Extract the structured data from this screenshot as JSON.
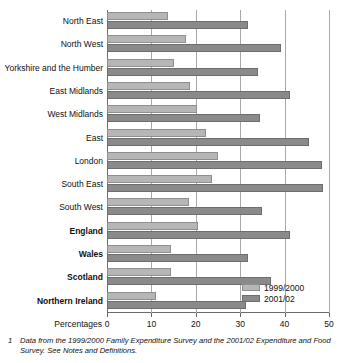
{
  "chart_data": {
    "type": "bar",
    "orientation": "horizontal",
    "title": "",
    "xlabel": "Percentages",
    "ylabel": "",
    "xlim": [
      0,
      50
    ],
    "xticks": [
      0,
      10,
      20,
      30,
      40,
      50
    ],
    "xtick_labels": [
      "0",
      "10",
      "20",
      "30",
      "40",
      "50"
    ],
    "grid": true,
    "legend_position": "bottom-right",
    "categories": [
      "North East",
      "North West",
      "Yorkshire and the Humber",
      "East Midlands",
      "West Midlands",
      "East",
      "London",
      "South East",
      "South West",
      "England",
      "Wales",
      "Scotland",
      "Northern Ireland"
    ],
    "bold_categories": [
      "England",
      "Wales",
      "Scotland",
      "Northern Ireland"
    ],
    "series": [
      {
        "name": "1999/2000",
        "color": "#b6b6b6",
        "values": [
          13.7,
          17.8,
          15.1,
          18.7,
          20.3,
          22.3,
          25.0,
          23.6,
          18.5,
          20.5,
          14.4,
          14.4,
          11.0
        ]
      },
      {
        "name": "2001/02",
        "color": "#8a8a8a",
        "values": [
          31.8,
          39.2,
          34.0,
          41.2,
          34.5,
          45.5,
          48.4,
          48.6,
          34.9,
          41.2,
          31.8,
          36.9,
          31.3
        ]
      }
    ]
  },
  "axis": {
    "x_title": "Percentages"
  },
  "legend": {
    "items": [
      {
        "label": "1999/2000"
      },
      {
        "label": "2001/02"
      }
    ]
  },
  "footnote": {
    "marker": "1",
    "text": "Data from the 1999/2000 Family Expenditure Survey and the 2001/02 Expenditure and Food Survey. See Notes and Definitions."
  }
}
